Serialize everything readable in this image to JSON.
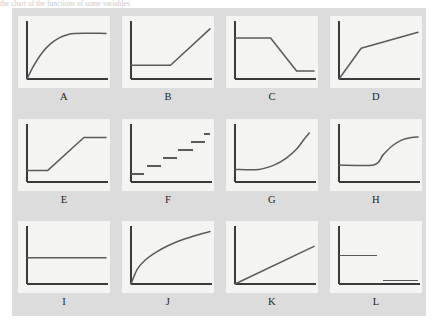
{
  "caption": {
    "text": "the chart of the functions of some variables"
  },
  "figure": {
    "background_color": "#dcdcdc",
    "panel_background_color": "#f4f4f2",
    "axis_color": "#3a3a3a",
    "curve_color": "#5a5a5a",
    "rows": 3,
    "columns": 4
  },
  "chart_data": {
    "type": "line",
    "title": "",
    "xlabel": "",
    "ylabel": "",
    "grid": false,
    "legend": "none",
    "axis_ranges": {
      "xlim": [
        0,
        100
      ],
      "ylim": [
        0,
        100
      ]
    },
    "panel_count": 12,
    "panels": [
      {
        "label": "A",
        "shape": "increasing-concave-then-plateau",
        "description": "Rises steeply from the origin, curving over to a flat plateau",
        "x": [
          0,
          8,
          18,
          30,
          42,
          52,
          60,
          100
        ],
        "y": [
          0,
          22,
          44,
          62,
          73,
          78,
          80,
          80
        ]
      },
      {
        "label": "B",
        "shape": "flat-then-linear-increase",
        "description": "Constant low value, then a straight rising line (hockey stick)",
        "x": [
          0,
          50,
          100
        ],
        "y": [
          24,
          24,
          88
        ]
      },
      {
        "label": "C",
        "shape": "high-plateau-decline-low-plateau",
        "description": "High constant value, linear decline, then low constant value",
        "x": [
          0,
          45,
          78,
          100
        ],
        "y": [
          72,
          72,
          14,
          14
        ]
      },
      {
        "label": "D",
        "shape": "steep-then-shallow-linear",
        "description": "Steep linear rise from origin, then a shallower linear rise",
        "x": [
          0,
          28,
          100
        ],
        "y": [
          0,
          54,
          82
        ]
      },
      {
        "label": "E",
        "shape": "flat-ramp-flat",
        "description": "Low plateau, linear ramp upward, then high plateau",
        "x": [
          0,
          26,
          72,
          100
        ],
        "y": [
          20,
          20,
          78,
          78
        ]
      },
      {
        "label": "F",
        "shape": "ascending-step-function",
        "description": "Six disconnected horizontal segments forming an ascending staircase",
        "steps": [
          {
            "x_start": 0,
            "x_end": 16,
            "y": 14
          },
          {
            "x_start": 20,
            "x_end": 38,
            "y": 28
          },
          {
            "x_start": 40,
            "x_end": 58,
            "y": 42
          },
          {
            "x_start": 60,
            "x_end": 78,
            "y": 56
          },
          {
            "x_start": 76,
            "x_end": 94,
            "y": 70
          },
          {
            "x_start": 92,
            "x_end": 100,
            "y": 84
          }
        ]
      },
      {
        "label": "G",
        "shape": "flat-then-convex-increase",
        "description": "Constant low value, then an accelerating exponential-like rise",
        "x": [
          0,
          30,
          50,
          65,
          78,
          88,
          94
        ],
        "y": [
          22,
          22,
          30,
          42,
          58,
          76,
          86
        ]
      },
      {
        "label": "H",
        "shape": "flat-then-concave-rise-to-plateau",
        "description": "Constant low value, then a smooth concave rise to a higher plateau",
        "x": [
          0,
          44,
          56,
          68,
          80,
          92,
          100
        ],
        "y": [
          30,
          30,
          48,
          64,
          74,
          78,
          79
        ]
      },
      {
        "label": "I",
        "shape": "constant",
        "description": "A single flat horizontal line at mid height",
        "x": [
          0,
          100
        ],
        "y": [
          46,
          46
        ]
      },
      {
        "label": "J",
        "shape": "logarithmic-increase",
        "description": "Concave increasing curve from the origin, continually rising",
        "x": [
          0,
          8,
          18,
          32,
          48,
          66,
          84,
          100
        ],
        "y": [
          0,
          26,
          42,
          56,
          68,
          78,
          86,
          92
        ]
      },
      {
        "label": "K",
        "shape": "linear-increase",
        "description": "Straight line rising from the origin at a constant slope",
        "x": [
          0,
          100
        ],
        "y": [
          0,
          66
        ]
      },
      {
        "label": "L",
        "shape": "discontinuous-step-down",
        "description": "Mid-height horizontal segment on the left, low horizontal segment on the right",
        "steps": [
          {
            "x_start": 0,
            "x_end": 48,
            "y": 50
          },
          {
            "x_start": 56,
            "x_end": 100,
            "y": 6
          }
        ]
      }
    ]
  }
}
